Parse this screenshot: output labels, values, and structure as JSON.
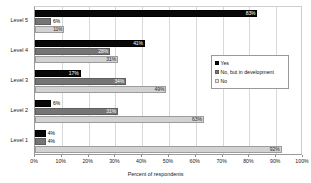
{
  "chart_data": {
    "type": "bar",
    "orientation": "horizontal",
    "title": "",
    "subtitle": "",
    "xlabel": "Percent of respondents",
    "ylabel": "",
    "xlim": [
      0,
      100
    ],
    "xtick_labels": [
      "0%",
      "10%",
      "20%",
      "30%",
      "40%",
      "50%",
      "60%",
      "70%",
      "80%",
      "90%",
      "100%"
    ],
    "xtick_values": [
      0,
      10,
      20,
      30,
      40,
      50,
      60,
      70,
      80,
      90,
      100
    ],
    "grid": true,
    "grid_axis": "x",
    "legend_position": "right",
    "categories": [
      "Level 5",
      "Level 4",
      "Level 3",
      "Level 2",
      "Level 1"
    ],
    "series": [
      {
        "name": "Yes",
        "color": "#080808",
        "values": [
          83,
          41,
          17,
          6,
          4
        ],
        "labels": [
          "83%",
          "41%",
          "17%",
          "6%",
          "4%"
        ]
      },
      {
        "name": "No, but in development",
        "color": "#757575",
        "values": [
          6,
          28,
          34,
          31,
          4
        ],
        "labels": [
          "6%",
          "28%",
          "34%",
          "31%",
          "4%"
        ]
      },
      {
        "name": "No",
        "color": "#d2d2d2",
        "values": [
          11,
          31,
          49,
          63,
          92
        ],
        "labels": [
          "11%",
          "31%",
          "49%",
          "63%",
          "92%"
        ]
      }
    ]
  },
  "legend": {
    "items": [
      {
        "label": "Yes",
        "swatch": "s0"
      },
      {
        "label": "No, but in development",
        "swatch": "s1"
      },
      {
        "label": "No",
        "swatch": "s2"
      }
    ]
  },
  "axis": {
    "x_title": "Percent of respondents"
  }
}
